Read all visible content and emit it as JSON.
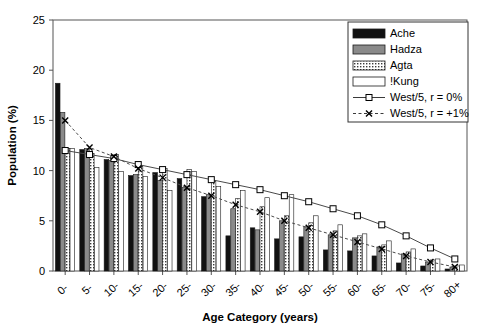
{
  "chart_data": {
    "type": "bar",
    "title": "",
    "xlabel": "Age Category (years)",
    "ylabel": "Population (%)",
    "ylim": [
      0,
      25
    ],
    "yticks": [
      0,
      5,
      10,
      15,
      20,
      25
    ],
    "grid": false,
    "legend_position": "top-right",
    "categories": [
      "0-",
      "5-",
      "10-",
      "15-",
      "20-",
      "25-",
      "30-",
      "35-",
      "40-",
      "45-",
      "50-",
      "55-",
      "60-",
      "65-",
      "70-",
      "75-",
      "80+"
    ],
    "series": [
      {
        "name": "Ache",
        "style": "bar",
        "fill": "#111111",
        "values": [
          18.7,
          12.1,
          11.1,
          9.5,
          9.8,
          9.2,
          7.4,
          3.5,
          4.3,
          3.2,
          3.4,
          2.1,
          2.0,
          1.5,
          0.8,
          0.5,
          0.2
        ]
      },
      {
        "name": "Hadza",
        "style": "bar",
        "fill": "#8a8a8a",
        "values": [
          15.8,
          12.2,
          11.0,
          9.6,
          9.0,
          8.3,
          7.6,
          6.2,
          4.1,
          5.0,
          4.4,
          3.6,
          3.3,
          2.4,
          1.7,
          0.9,
          0.4
        ]
      },
      {
        "name": "Agta",
        "style": "bar",
        "fill": "#ffffff",
        "pattern": "dots",
        "values": [
          12.2,
          11.7,
          11.6,
          10.4,
          10.2,
          10.1,
          8.9,
          7.2,
          6.4,
          5.5,
          4.8,
          4.0,
          3.5,
          2.6,
          1.9,
          1.1,
          0.5
        ]
      },
      {
        "name": "!Kung",
        "style": "bar",
        "fill": "#ffffff",
        "values": [
          12.2,
          10.3,
          9.9,
          9.4,
          8.0,
          9.9,
          8.4,
          8.0,
          7.3,
          7.6,
          5.5,
          4.6,
          3.7,
          3.0,
          2.2,
          1.2,
          0.6
        ]
      },
      {
        "name": "West/5, r = 0%",
        "style": "line-square",
        "values": [
          12.0,
          11.6,
          11.2,
          10.6,
          10.1,
          9.6,
          9.1,
          8.6,
          8.1,
          7.5,
          6.9,
          6.2,
          5.5,
          4.6,
          3.5,
          2.3,
          1.2
        ]
      },
      {
        "name": "West/5, r = +1%",
        "style": "line-x-dashed",
        "values": [
          15.0,
          12.3,
          11.4,
          10.2,
          9.3,
          8.3,
          7.5,
          6.6,
          5.9,
          5.0,
          4.3,
          3.6,
          2.9,
          2.2,
          1.5,
          0.9,
          0.4
        ]
      }
    ]
  }
}
